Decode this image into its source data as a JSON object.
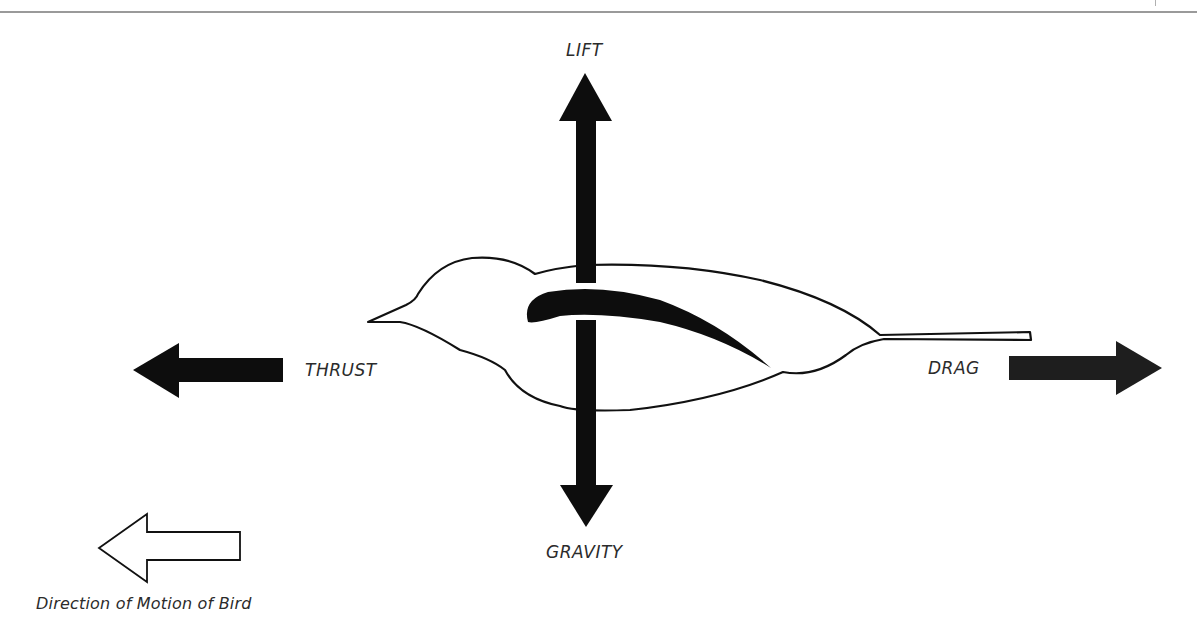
{
  "diagram": {
    "labels": {
      "lift": "LIFT",
      "gravity": "GRAVITY",
      "thrust": "THRUST",
      "drag": "DRAG",
      "direction": "Direction of Motion of Bird"
    },
    "forces": [
      {
        "name": "LIFT",
        "direction": "up",
        "style": "solid"
      },
      {
        "name": "GRAVITY",
        "direction": "down",
        "style": "solid"
      },
      {
        "name": "THRUST",
        "direction": "left",
        "style": "solid"
      },
      {
        "name": "DRAG",
        "direction": "right",
        "style": "solid"
      }
    ],
    "motion_indicator": {
      "direction": "left",
      "style": "outline"
    },
    "colors": {
      "arrow_fill": "#0d0d0d",
      "drag_arrow_fill": "#1e1e1e",
      "outline": "#111111",
      "text": "#2b2b2b",
      "rule": "#9a9a9a"
    }
  }
}
